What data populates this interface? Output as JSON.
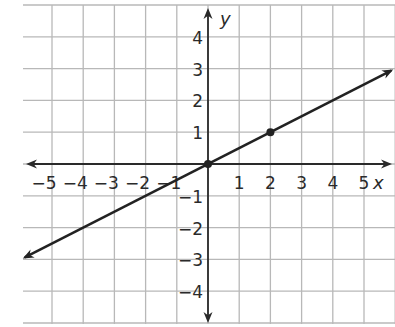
{
  "chart_data": {
    "type": "line",
    "title": "",
    "xlabel": "x",
    "ylabel": "y",
    "xlim": [
      -6,
      6
    ],
    "ylim": [
      -5,
      5
    ],
    "grid": true,
    "x_ticks": [
      "-5",
      "-4",
      "-3",
      "-2",
      "-1",
      "1",
      "2",
      "3",
      "4",
      "5"
    ],
    "y_ticks": [
      "4",
      "3",
      "2",
      "1",
      "-1",
      "-2",
      "-3",
      "-4"
    ],
    "series": [
      {
        "name": "line",
        "equation": "y = 0.5x",
        "x": [
          -6,
          6
        ],
        "y": [
          -3,
          3
        ],
        "arrows": "both"
      }
    ],
    "points": [
      {
        "x": 0,
        "y": 0
      },
      {
        "x": 2,
        "y": 1
      }
    ]
  },
  "colors": {
    "grid": "#b8b8b8",
    "axis": "#2a2a2a",
    "line": "#222222"
  }
}
